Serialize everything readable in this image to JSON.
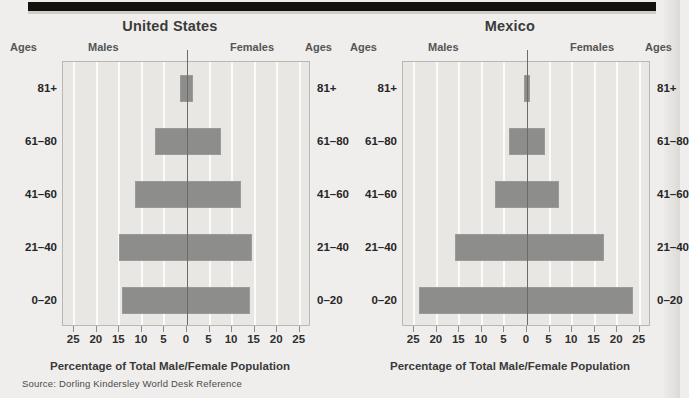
{
  "figure": {
    "source_note": "Source:  Dorling Kindersley World Desk Reference",
    "axis_caption": "Percentage of Total Male/Female Population",
    "header": {
      "ages_left": "Ages",
      "males": "Males",
      "females": "Females",
      "ages_right": "Ages"
    },
    "colors": {
      "background": "#efeeec",
      "plot_background": "#e8e7e4",
      "bar": "#8d8d8b",
      "gridline": "#fbfbfa",
      "zero_line": "#6d6a67",
      "rule": "#14110f"
    }
  },
  "chart_data": [
    {
      "type": "bar",
      "title": "United States",
      "subtype": "population-pyramid",
      "xlabel": "Percentage of Total Male/Female Population",
      "ylabel": "Ages",
      "categories": [
        "0–20",
        "21–40",
        "41–60",
        "61–80",
        "81+"
      ],
      "tick_values": [
        25,
        20,
        15,
        10,
        5,
        0,
        5,
        10,
        15,
        20,
        25
      ],
      "tick_labels": [
        "25",
        "20",
        "15",
        "10",
        "5",
        "0",
        "5",
        "10",
        "15",
        "20",
        "25"
      ],
      "xlim": [
        -27.5,
        27.5
      ],
      "grid": true,
      "legend": "none",
      "series": [
        {
          "name": "Males",
          "values": [
            14.5,
            15.0,
            11.5,
            7.0,
            1.5
          ]
        },
        {
          "name": "Females",
          "values": [
            14.0,
            14.5,
            12.0,
            7.5,
            1.3
          ]
        }
      ]
    },
    {
      "type": "bar",
      "title": "Mexico",
      "subtype": "population-pyramid",
      "xlabel": "Percentage of Total Male/Female Population",
      "ylabel": "Ages",
      "categories": [
        "0–20",
        "21–40",
        "41–60",
        "61–80",
        "81+"
      ],
      "tick_values": [
        25,
        20,
        15,
        10,
        5,
        0,
        5,
        10,
        15,
        20,
        25
      ],
      "tick_labels": [
        "25",
        "20",
        "15",
        "10",
        "5",
        "0",
        "5",
        "10",
        "15",
        "20",
        "25"
      ],
      "xlim": [
        -27.5,
        27.5
      ],
      "grid": true,
      "legend": "none",
      "series": [
        {
          "name": "Males",
          "values": [
            24.0,
            16.0,
            7.0,
            4.0,
            0.6
          ]
        },
        {
          "name": "Females",
          "values": [
            23.5,
            17.0,
            7.0,
            4.0,
            0.6
          ]
        }
      ]
    }
  ]
}
